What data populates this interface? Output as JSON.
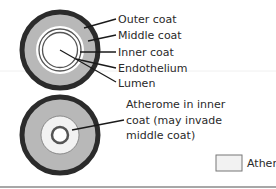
{
  "diagram": {
    "normal_artery": {
      "labels": [
        "Outer coat",
        "Middle coat",
        "Inner coat",
        "Endothelium",
        "Lumen"
      ]
    },
    "diseased_artery": {
      "label_lines": [
        "Atherome in inner",
        "coat (may invade",
        "middle coat)"
      ]
    },
    "legend": {
      "label": "Atheroma"
    },
    "colors": {
      "outer_coat": "#2b2b2b",
      "middle_coat": "#b8b8b8",
      "inner_coat": "#ffffff",
      "ring_stroke": "#555555",
      "atheroma": "#f2f2f2",
      "text": "#2a2a2a",
      "rule": "#8a8a8a"
    }
  }
}
